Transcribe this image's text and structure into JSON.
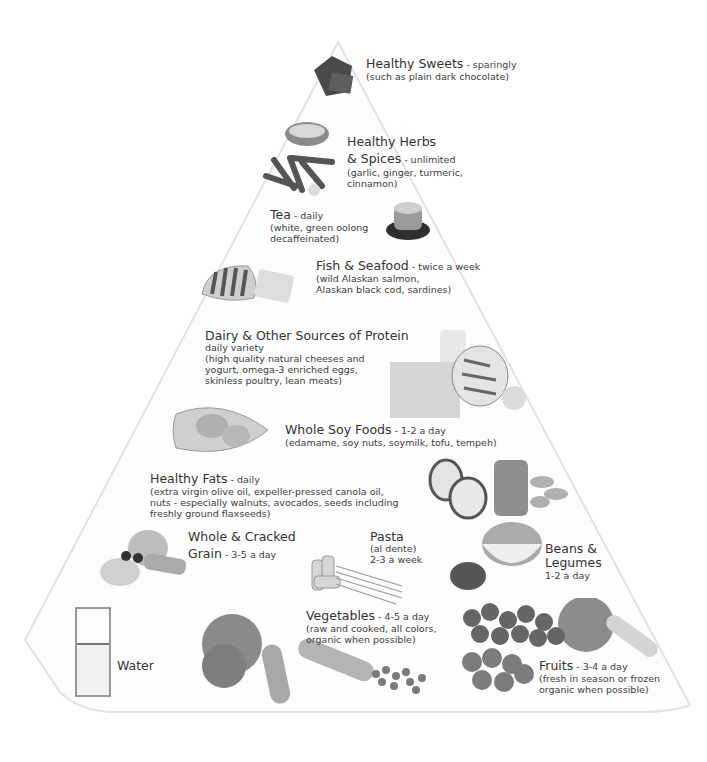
{
  "diagram": {
    "type": "food-pyramid",
    "tiers": [
      {
        "id": "sweets",
        "title": "Healthy Sweets",
        "serving": " - sparingly",
        "desc": [
          "(such as plain dark chocolate)"
        ]
      },
      {
        "id": "herbs",
        "title": "Healthy Herbs",
        "title2": "& Spices",
        "serving": " - unlimited",
        "desc": [
          "(garlic, ginger, turmeric,",
          "cinnamon)"
        ]
      },
      {
        "id": "tea",
        "title": "Tea",
        "serving": " - daily",
        "desc": [
          "(white, green oolong",
          "decaffeinated)"
        ]
      },
      {
        "id": "fish",
        "title": "Fish & Seafood",
        "serving": " - twice a week",
        "desc": [
          "(wild Alaskan salmon,",
          "Alaskan black cod, sardines)"
        ]
      },
      {
        "id": "dairy",
        "title": "Dairy & Other Sources of Protein",
        "serving": "daily variety",
        "desc": [
          "(high quality natural cheeses  and",
          "yogurt, omega-3 enriched eggs,",
          "skinless poultry, lean meats)"
        ]
      },
      {
        "id": "soy",
        "title": "Whole Soy Foods",
        "serving": " - 1-2 a day",
        "desc": [
          "(edamame, soy nuts, soymilk, tofu, tempeh)"
        ]
      },
      {
        "id": "fats",
        "title": "Healthy Fats",
        "serving": " - daily",
        "desc": [
          "(extra virgin olive oil, expeller-pressed canola oil,",
          "nuts - especially walnuts, avocados, seeds including",
          "freshly ground flaxseeds)"
        ]
      },
      {
        "id": "grain",
        "title": "Whole & Cracked",
        "title2": "Grain",
        "serving": " - 3-5 a day",
        "desc": []
      },
      {
        "id": "pasta",
        "title": "Pasta",
        "serving": "",
        "desc": [
          "(al dente)",
          "2-3 a week"
        ]
      },
      {
        "id": "beans",
        "title": "Beans &",
        "title2": "Legumes",
        "serving": "1-2 a day",
        "desc": []
      },
      {
        "id": "water",
        "title": "Water",
        "serving": "",
        "desc": []
      },
      {
        "id": "vegetables",
        "title": "Vegetables",
        "serving": " - 4-5 a day",
        "desc": [
          "(raw and cooked, all colors,",
          "organic when possible)"
        ]
      },
      {
        "id": "fruits",
        "title": "Fruits",
        "serving": " - 3-4 a day",
        "desc": [
          "(fresh in season or frozen",
          "organic when possible)"
        ]
      }
    ]
  }
}
